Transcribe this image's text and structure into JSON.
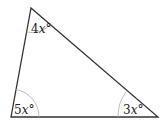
{
  "diagram": {
    "type": "triangle",
    "vertices": {
      "top": [
        31,
        8
      ],
      "bottom_left": [
        11,
        117
      ],
      "bottom_right": [
        158,
        117
      ]
    },
    "angles": [
      {
        "vertex": "top",
        "label": "4x°",
        "coef": "4",
        "var": "x"
      },
      {
        "vertex": "bottom_left",
        "label": "5x°",
        "coef": "5",
        "var": "x"
      },
      {
        "vertex": "bottom_right",
        "label": "3x°",
        "coef": "3",
        "var": "x"
      }
    ],
    "colors": {
      "edge": "#333333",
      "arc": "#aaaaaa",
      "text": "#222222"
    }
  }
}
